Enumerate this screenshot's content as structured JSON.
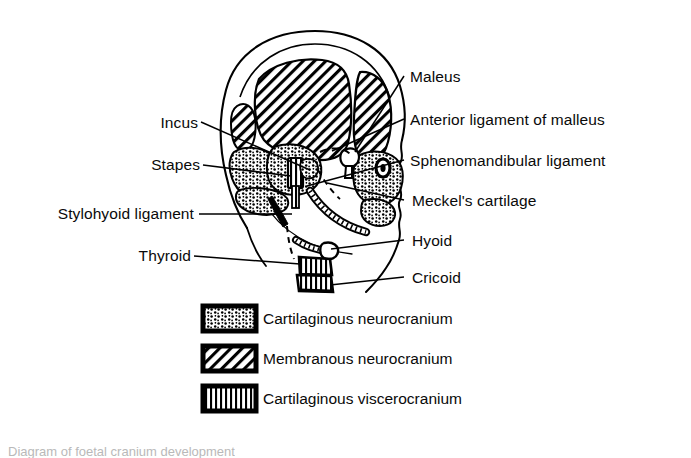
{
  "figure": {
    "background_color": "#ffffff",
    "ink_color": "#000000",
    "title_caption": "Diagram of foetal cranium development"
  },
  "labels_right": [
    {
      "id": "maleus",
      "text": "Maleus"
    },
    {
      "id": "anterior-ligament-of-malleus",
      "text": "Anterior ligament of malleus"
    },
    {
      "id": "sphenomandibular-ligament",
      "text": "Sphenomandibular ligament"
    },
    {
      "id": "meckels-cartilage",
      "text": "Meckel's cartilage"
    },
    {
      "id": "hyoid",
      "text": "Hyoid"
    },
    {
      "id": "cricoid",
      "text": "Cricoid"
    }
  ],
  "labels_left": [
    {
      "id": "incus",
      "text": "Incus"
    },
    {
      "id": "stapes",
      "text": "Stapes"
    },
    {
      "id": "stylohyoid-ligament",
      "text": "Stylohyoid ligament"
    },
    {
      "id": "thyroid",
      "text": "Thyroid"
    }
  ],
  "legend": {
    "items": [
      {
        "id": "cartilaginous-neurocranium",
        "text": "Cartilaginous neurocranium",
        "pattern": "stipple"
      },
      {
        "id": "membranous-neurocranium",
        "text": "Membranous neurocranium",
        "pattern": "diagonal-hatch"
      },
      {
        "id": "cartilaginous-viscerocranium",
        "text": "Cartilaginous viscerocranium",
        "pattern": "vertical-lines"
      }
    ]
  }
}
